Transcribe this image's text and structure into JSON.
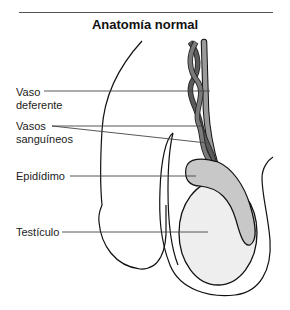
{
  "title": "Anatomía normal",
  "labels": {
    "vas_deferens_line1": "Vaso",
    "vas_deferens_line2": "deferente",
    "blood_vessels_line1": "Vasos",
    "blood_vessels_line2": "sanguíneos",
    "epididymis": "Epidídimo",
    "testicle": "Testículo"
  },
  "colors": {
    "vas_deferens": "#9a9a9a",
    "vessels_dark": "#555555",
    "epididymis": "#c8c8c8",
    "testicle": "#eeeeee",
    "outline": "#111111",
    "leader_line": "#444444"
  }
}
